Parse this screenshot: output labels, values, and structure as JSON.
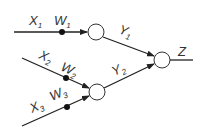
{
  "diagram": {
    "type": "neural-network",
    "colors": {
      "stroke": "#222222",
      "node_fill": "#ffffff",
      "dot": "#111111",
      "text": "#333333"
    },
    "inputs": [
      {
        "name": "X",
        "sub": "1",
        "weight": "W",
        "weight_sub": "1"
      },
      {
        "name": "X",
        "sub": "2",
        "weight": "W",
        "weight_sub": "2"
      },
      {
        "name": "X",
        "sub": "3",
        "weight": "W",
        "weight_sub": "3"
      }
    ],
    "hidden": [
      {
        "name": "Y",
        "sub": "1"
      },
      {
        "name": "Y",
        "sub": "2"
      }
    ],
    "output": {
      "name": "Z"
    }
  }
}
